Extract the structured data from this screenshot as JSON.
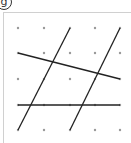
{
  "figure": {
    "label": "g",
    "grid": {
      "columns": 5,
      "rows": 5,
      "x_positions": [
        18,
        44,
        70,
        95,
        120
      ],
      "y_positions": [
        28,
        53,
        79,
        105,
        130
      ],
      "dot_color": "#999999"
    },
    "line_color": "#222222",
    "segments": [
      {
        "name": "slanted-line",
        "from": [
          0,
          1
        ],
        "to": [
          4,
          2
        ]
      },
      {
        "name": "horizontal-line",
        "from": [
          0,
          3
        ],
        "to": [
          4,
          3
        ]
      },
      {
        "name": "steep-line-left",
        "from": [
          0,
          4
        ],
        "to": [
          2,
          0
        ]
      },
      {
        "name": "steep-line-right",
        "from": [
          2,
          4
        ],
        "to": [
          4,
          0
        ]
      }
    ]
  }
}
